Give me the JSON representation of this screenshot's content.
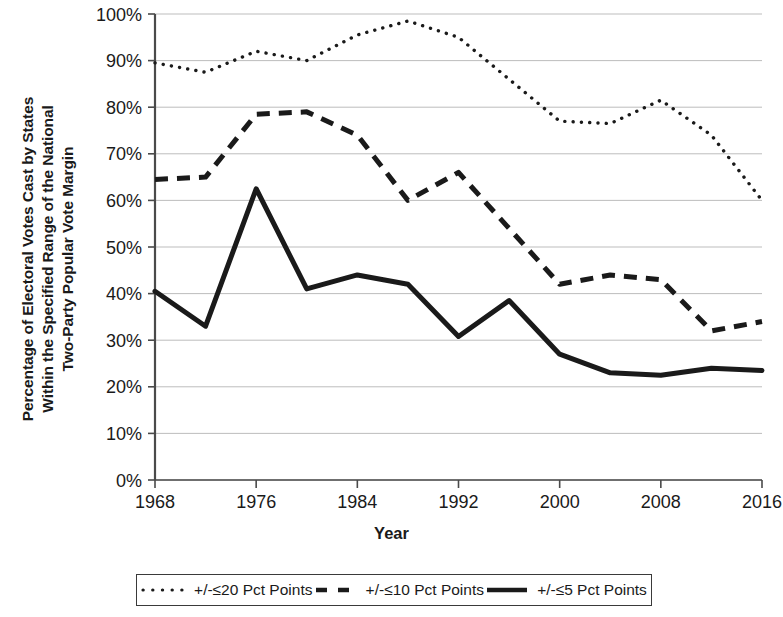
{
  "axes": {
    "y_title_lines": [
      "Percentage of Electoral Votes Cast by States",
      "Within the Specified Range of the National",
      "Two-Party Popular Vote Margin"
    ],
    "x_title": "Year",
    "y_ticks": [
      "0%",
      "10%",
      "20%",
      "30%",
      "40%",
      "50%",
      "60%",
      "70%",
      "80%",
      "90%",
      "100%"
    ],
    "x_ticks": [
      "1968",
      "1976",
      "1984",
      "1992",
      "2000",
      "2008",
      "2016"
    ]
  },
  "legend": {
    "items": [
      {
        "label": "+/-≤20 Pct Points",
        "style": "dotted",
        "color": "#1a1a1a"
      },
      {
        "label": "+/-≤10 Pct Points",
        "style": "dashed",
        "color": "#1a1a1a"
      },
      {
        "label": "+/-≤5 Pct Points",
        "style": "solid",
        "color": "#1a1a1a"
      }
    ]
  },
  "chart_data": {
    "type": "line",
    "title": "",
    "xlabel": "Year",
    "ylabel": "Percentage of Electoral Votes Cast by States Within the Specified Range of the National Two-Party Popular Vote Margin",
    "x": [
      1968,
      1972,
      1976,
      1980,
      1984,
      1988,
      1992,
      1996,
      2000,
      2004,
      2008,
      2012,
      2016
    ],
    "xlim": [
      1968,
      2016
    ],
    "ylim": [
      0,
      100
    ],
    "ytick_values": [
      0,
      10,
      20,
      30,
      40,
      50,
      60,
      70,
      80,
      90,
      100
    ],
    "xtick_values": [
      1968,
      1976,
      1984,
      1992,
      2000,
      2008,
      2016
    ],
    "grid": "horizontal",
    "legend_position": "bottom",
    "series": [
      {
        "name": "+/-≤20 Pct Points",
        "style": "dotted",
        "color": "#1a1a1a",
        "values": [
          89.5,
          87.5,
          92.0,
          90.0,
          95.5,
          98.5,
          95.0,
          86.0,
          77.0,
          76.5,
          81.5,
          74.0,
          60.0
        ]
      },
      {
        "name": "+/-≤10 Pct Points",
        "style": "dashed",
        "color": "#1a1a1a",
        "values": [
          64.5,
          65.0,
          78.5,
          79.0,
          74.0,
          60.0,
          66.0,
          54.0,
          42.0,
          44.0,
          43.0,
          32.0,
          34.0
        ]
      },
      {
        "name": "+/-≤5 Pct Points",
        "style": "solid",
        "color": "#1a1a1a",
        "values": [
          40.5,
          33.0,
          62.5,
          41.0,
          44.0,
          42.0,
          30.8,
          38.5,
          27.0,
          23.0,
          22.5,
          24.0,
          23.5
        ]
      }
    ]
  },
  "plot_geometry": {
    "left": 155,
    "right": 762,
    "top": 14,
    "bottom": 480
  }
}
